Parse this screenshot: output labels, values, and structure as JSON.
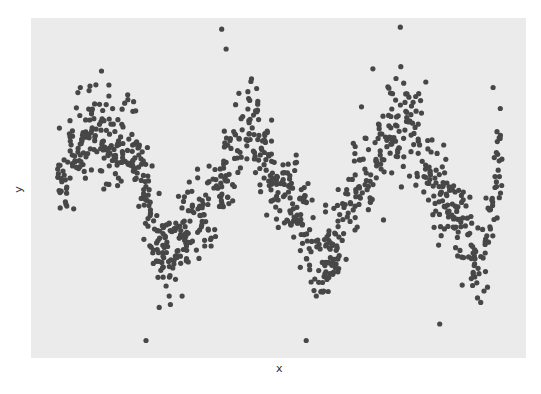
{
  "chart_data": {
    "type": "scatter",
    "title": "",
    "xlabel": "x",
    "ylabel": "y",
    "grid": false,
    "legend": null,
    "axis_ticks_shown": false,
    "panel_background": "#ebebeb",
    "point_color": "#474747",
    "point_radius_px": 2.6,
    "n_points": 1000,
    "model": {
      "form": "y = A*sin(2*pi*f*x + phase) + noise",
      "A": 0.62,
      "f": 2.88,
      "phase": 0.0,
      "noise_sd": 0.22,
      "x_range": [
        0,
        1
      ]
    },
    "trend_anchors": {
      "x": [
        0.0,
        0.07,
        0.17,
        0.24,
        0.35,
        0.43,
        0.52,
        0.6,
        0.69,
        0.78,
        0.87,
        0.95,
        1.0
      ],
      "y": [
        0.1,
        0.55,
        0.35,
        -0.55,
        -0.1,
        0.6,
        -0.1,
        -0.6,
        0.15,
        0.65,
        -0.05,
        -0.6,
        0.3
      ]
    },
    "notable_outliers": [
      {
        "x": 0.1,
        "y": 1.1
      },
      {
        "x": 0.37,
        "y": 1.48
      },
      {
        "x": 0.38,
        "y": 1.3
      },
      {
        "x": 0.2,
        "y": -1.35
      },
      {
        "x": 0.56,
        "y": -1.35
      },
      {
        "x": 0.71,
        "y": 1.12
      },
      {
        "x": 0.98,
        "y": 0.95
      },
      {
        "x": 0.86,
        "y": -1.2
      }
    ],
    "plot_area_px": {
      "left": 31,
      "top": 18,
      "right": 526,
      "bottom": 358
    },
    "data_area_px": {
      "x0": 57,
      "x1": 502,
      "y_center": 192,
      "y_unit_px": 110
    },
    "seed": 42
  },
  "axes": {
    "x_title": "x",
    "y_title": "y"
  }
}
